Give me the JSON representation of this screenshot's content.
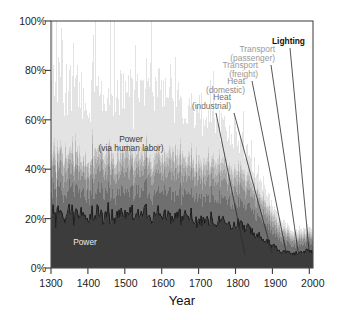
{
  "chart_data": {
    "type": "area",
    "title": "",
    "xlabel": "Year",
    "ylabel": "",
    "xlim": [
      1300,
      2010
    ],
    "ylim": [
      0,
      100
    ],
    "grid": false,
    "legend_position": "annotations-inline",
    "x_ticks": [
      "1300",
      "1400",
      "1500",
      "1600",
      "1700",
      "1800",
      "1900",
      "2000"
    ],
    "x_tick_values": [
      1300,
      1400,
      1500,
      1600,
      1700,
      1800,
      1900,
      2000
    ],
    "y_ticks": [
      "0%",
      "20%",
      "40%",
      "60%",
      "80%",
      "100%"
    ],
    "y_tick_values": [
      0,
      20,
      40,
      60,
      80,
      100
    ],
    "series": [
      {
        "name": "Power",
        "color": "#3c3c3c",
        "label_type": "inline",
        "x": [
          1300,
          1350,
          1400,
          1450,
          1500,
          1550,
          1600,
          1650,
          1700,
          1750,
          1800,
          1850,
          1875,
          1900,
          1925,
          1950,
          1975,
          2000
        ],
        "values": [
          22,
          22,
          21,
          22,
          21,
          22,
          21,
          21,
          20,
          19,
          18,
          15,
          12,
          9,
          7,
          6,
          6,
          7
        ]
      },
      {
        "name": "Heat (industrial)",
        "color": "#6f6f6f",
        "label_type": "callout",
        "x": [
          1300,
          1350,
          1400,
          1450,
          1500,
          1550,
          1600,
          1650,
          1700,
          1750,
          1800,
          1850,
          1875,
          1900,
          1925,
          1950,
          1975,
          2000
        ],
        "values": [
          9,
          9,
          9,
          9,
          9,
          9,
          9,
          9,
          9,
          9,
          9,
          8,
          7,
          5,
          4,
          3,
          3,
          3
        ]
      },
      {
        "name": "Heat (domestic)",
        "color": "#8c8c8c",
        "label_type": "callout",
        "x": [
          1300,
          1350,
          1400,
          1450,
          1500,
          1550,
          1600,
          1650,
          1700,
          1750,
          1800,
          1850,
          1875,
          1900,
          1925,
          1950,
          1975,
          2000
        ],
        "values": [
          7,
          7,
          7,
          7,
          7,
          7,
          7,
          7,
          7,
          7,
          6,
          5,
          4,
          3,
          2,
          2,
          2,
          2
        ]
      },
      {
        "name": "Transport (freight)",
        "color": "#a6a6a6",
        "label_type": "callout",
        "x": [
          1300,
          1350,
          1400,
          1450,
          1500,
          1550,
          1600,
          1650,
          1700,
          1750,
          1800,
          1850,
          1875,
          1900,
          1925,
          1950,
          1975,
          2000
        ],
        "values": [
          4,
          4,
          4,
          4,
          4,
          4,
          4,
          4,
          4,
          4,
          4,
          3,
          3,
          2,
          2,
          1,
          1,
          1
        ]
      },
      {
        "name": "Transport (passenger)",
        "color": "#bcbcbc",
        "label_type": "callout",
        "x": [
          1300,
          1350,
          1400,
          1450,
          1500,
          1550,
          1600,
          1650,
          1700,
          1750,
          1800,
          1850,
          1875,
          1900,
          1925,
          1950,
          1975,
          2000
        ],
        "values": [
          3,
          3,
          3,
          3,
          3,
          3,
          3,
          3,
          3,
          3,
          3,
          2,
          2,
          2,
          1,
          1,
          1,
          1
        ]
      },
      {
        "name": "Lighting",
        "color": "#d2d2d2",
        "label_type": "callout",
        "x": [
          1300,
          1350,
          1400,
          1450,
          1500,
          1550,
          1600,
          1650,
          1700,
          1750,
          1800,
          1850,
          1875,
          1900,
          1925,
          1950,
          1975,
          2000
        ],
        "values": [
          2,
          2,
          2,
          2,
          2,
          2,
          2,
          2,
          2,
          2,
          2,
          2,
          1,
          1,
          1,
          1,
          1,
          1
        ]
      },
      {
        "name": "Power (via human labor)",
        "color": "#e3e3e3",
        "label_type": "inline",
        "x": [
          1300,
          1350,
          1400,
          1450,
          1500,
          1550,
          1600,
          1650,
          1700,
          1750,
          1800,
          1850,
          1875,
          1900,
          1925,
          1950,
          1975,
          2000
        ],
        "values": [
          25,
          30,
          28,
          30,
          27,
          32,
          34,
          26,
          20,
          16,
          12,
          8,
          6,
          4,
          3,
          2,
          2,
          2
        ]
      }
    ],
    "annotations": [
      {
        "text": "Power",
        "style": "light",
        "x": 1420,
        "y": 11
      },
      {
        "text": "Power",
        "style": "dark",
        "x": 1465,
        "y": 47
      },
      {
        "text": "(via human labor)",
        "style": "dark",
        "x": 1465,
        "y": 42
      },
      {
        "text": "Heat (industrial)",
        "style": "dk"
      },
      {
        "text": "Heat (domestic)",
        "style": "mid"
      },
      {
        "text": "Transport (freight)",
        "style": "grey"
      },
      {
        "text": "Transport (passenger)",
        "style": "grey"
      },
      {
        "text": "Lighting",
        "style": "black"
      }
    ]
  },
  "labels": {
    "power_inline": "Power",
    "power_human_line1": "Power",
    "power_human_line2": "(via human labor)",
    "heat_industrial_1": "Heat",
    "heat_industrial_2": "(industrial)",
    "heat_domestic_1": "Heat",
    "heat_domestic_2": "(domestic)",
    "transport_freight_1": "Transport",
    "transport_freight_2": "(freight)",
    "transport_passenger_1": "Transport",
    "transport_passenger_2": "(passenger)",
    "lighting": "Lighting",
    "x_axis_title": "Year",
    "y0": "0%",
    "y20": "20%",
    "y40": "40%",
    "y60": "60%",
    "y80": "80%",
    "y100": "100%",
    "x1300": "1300",
    "x1400": "1400",
    "x1500": "1500",
    "x1600": "1600",
    "x1700": "1700",
    "x1800": "1800",
    "x1900": "1900",
    "x2000": "2000"
  },
  "colors": {
    "power": "#3c3c3c",
    "heat_industrial": "#6f6f6f",
    "heat_domestic": "#8c8c8c",
    "transport_freight": "#a6a6a6",
    "transport_passenger": "#bcbcbc",
    "lighting": "#d2d2d2",
    "power_human": "#e3e3e3",
    "axis": "#3c3c3c",
    "background": "#ffffff"
  }
}
